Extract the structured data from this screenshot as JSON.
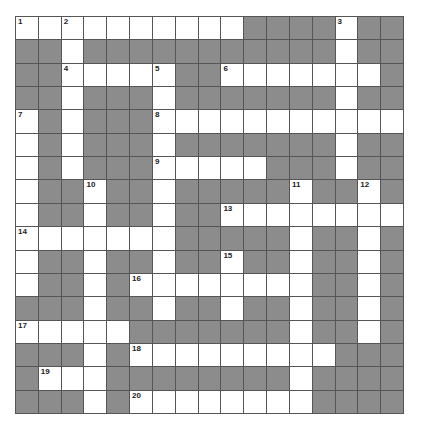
{
  "puzzle": {
    "rows": 17,
    "cols": 17,
    "colors": {
      "block": "#8c8c8c",
      "open": "#ffffff",
      "border": "#555555",
      "number": "#222222"
    },
    "layout": [
      "WWWWWWWWWWBBBBWBB",
      "BBWBBBBBBBBBBBWBB",
      "BBWWWWWBBWWWWWWWB",
      "BBWBBBWBBBBBBBWBB",
      "WBWBBBWWWWWWWWWWW",
      "WBWBBBWBBBBBBBWBB",
      "WBWBBBWWWWWBBBWBB",
      "WBBWBBWBBBBBWBBWB",
      "WBBWBBWBBWWWWWWWW",
      "WWWWWWWBBBBBWBBWB",
      "WBBWBBWBBWBBWBBWB",
      "WBBWBWWWWWWWWBBWB",
      "BBBWBBWBBWBBWBBWB",
      "WWWWWBBBBBBBWBBWB",
      "BBBWBWWWWWWWWWBBB",
      "BWWWBBBBBBBBWBBBB",
      "BBBWBWWWWWWWWBBBB"
    ],
    "numbers": [
      {
        "r": 0,
        "c": 0,
        "n": "1"
      },
      {
        "r": 0,
        "c": 2,
        "n": "2"
      },
      {
        "r": 0,
        "c": 14,
        "n": "3"
      },
      {
        "r": 2,
        "c": 2,
        "n": "4"
      },
      {
        "r": 2,
        "c": 6,
        "n": "5"
      },
      {
        "r": 2,
        "c": 9,
        "n": "6"
      },
      {
        "r": 4,
        "c": 0,
        "n": "7"
      },
      {
        "r": 4,
        "c": 6,
        "n": "8"
      },
      {
        "r": 6,
        "c": 6,
        "n": "9"
      },
      {
        "r": 7,
        "c": 3,
        "n": "10"
      },
      {
        "r": 7,
        "c": 12,
        "n": "11"
      },
      {
        "r": 7,
        "c": 15,
        "n": "12"
      },
      {
        "r": 8,
        "c": 9,
        "n": "13"
      },
      {
        "r": 9,
        "c": 0,
        "n": "14"
      },
      {
        "r": 10,
        "c": 9,
        "n": "15"
      },
      {
        "r": 11,
        "c": 5,
        "n": "16"
      },
      {
        "r": 13,
        "c": 0,
        "n": "17"
      },
      {
        "r": 14,
        "c": 5,
        "n": "18"
      },
      {
        "r": 15,
        "c": 1,
        "n": "19"
      },
      {
        "r": 16,
        "c": 5,
        "n": "20"
      }
    ],
    "entries": {
      "across": [
        "1",
        "4",
        "6",
        "8",
        "9",
        "13",
        "14",
        "16",
        "17",
        "18",
        "19",
        "20"
      ],
      "down": [
        "2",
        "3",
        "5",
        "7",
        "10",
        "11",
        "12",
        "15"
      ]
    }
  }
}
